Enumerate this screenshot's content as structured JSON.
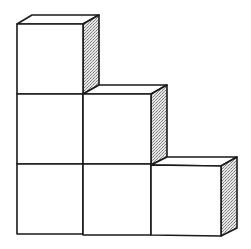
{
  "diagram": {
    "rows": [
      {
        "level": "top",
        "cube_count": 1
      },
      {
        "level": "middle",
        "cube_count": 2
      },
      {
        "level": "bottom",
        "cube_count": 3
      }
    ],
    "total_cubes": 6,
    "colors": {
      "stroke": "#1a1a1a",
      "shade": "#bdbdbd",
      "face": "#ffffff"
    }
  }
}
